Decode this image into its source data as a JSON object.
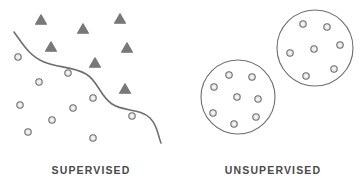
{
  "diagram": {
    "background_color": "#ffffff",
    "stroke_color": "#6e6e6e",
    "marker_fill": "#e8e8e8",
    "triangle_fill": "#787878",
    "label_color": "#4a4a4a"
  },
  "panels": [
    {
      "id": "supervised",
      "label": "SUPERVISED",
      "description": "Two labeled classes separated by a decision boundary curve",
      "boundary": {
        "name": "decision-boundary-curve",
        "path": "M 14 32 C 24 46 30 56 44 62 C 58 68 72 66 86 74 C 98 81 100 96 112 104 C 124 112 140 108 150 118 C 158 126 158 136 161 143",
        "stroke_width": 1.6
      },
      "triangles": [
        {
          "x": 41,
          "y": 20
        },
        {
          "x": 83,
          "y": 29
        },
        {
          "x": 120,
          "y": 19
        },
        {
          "x": 51,
          "y": 47
        },
        {
          "x": 127,
          "y": 48
        },
        {
          "x": 95,
          "y": 63
        },
        {
          "x": 125,
          "y": 89
        }
      ],
      "circles": [
        {
          "x": 18,
          "y": 57
        },
        {
          "x": 68,
          "y": 73
        },
        {
          "x": 39,
          "y": 82
        },
        {
          "x": 93,
          "y": 98
        },
        {
          "x": 20,
          "y": 105
        },
        {
          "x": 73,
          "y": 108
        },
        {
          "x": 52,
          "y": 120
        },
        {
          "x": 132,
          "y": 116
        },
        {
          "x": 28,
          "y": 132
        },
        {
          "x": 93,
          "y": 138
        }
      ]
    },
    {
      "id": "unsupervised",
      "label": "UNSUPERVISED",
      "description": "Two discovered clusters of unlabeled points",
      "clusters": [
        {
          "name": "cluster-upper-right",
          "cx": 133,
          "cy": 48,
          "r": 38,
          "points": [
            {
              "x": 121,
              "y": 24
            },
            {
              "x": 145,
              "y": 27
            },
            {
              "x": 158,
              "y": 45
            },
            {
              "x": 132,
              "y": 49
            },
            {
              "x": 108,
              "y": 53
            },
            {
              "x": 152,
              "y": 69
            },
            {
              "x": 124,
              "y": 76
            }
          ]
        },
        {
          "name": "cluster-lower-left",
          "cx": 56,
          "cy": 97,
          "r": 37,
          "points": [
            {
              "x": 47,
              "y": 75
            },
            {
              "x": 70,
              "y": 77
            },
            {
              "x": 32,
              "y": 87
            },
            {
              "x": 55,
              "y": 97
            },
            {
              "x": 76,
              "y": 99
            },
            {
              "x": 31,
              "y": 113
            },
            {
              "x": 74,
              "y": 117
            },
            {
              "x": 52,
              "y": 124
            }
          ]
        }
      ]
    }
  ]
}
